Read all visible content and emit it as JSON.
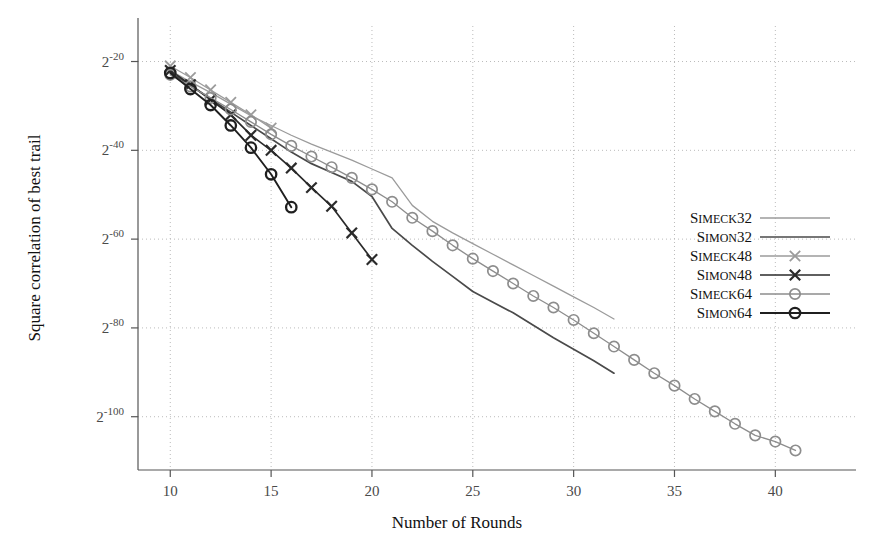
{
  "chart_data": {
    "type": "line",
    "title": "",
    "xlabel": "Number of Rounds",
    "ylabel": "Square correlation of best trail",
    "xlim": [
      8.4,
      44
    ],
    "ylim": [
      -112,
      -12
    ],
    "grid": true,
    "xticks": [
      10,
      15,
      20,
      25,
      30,
      35,
      40
    ],
    "xtick_labels": [
      "10",
      "15",
      "20",
      "25",
      "30",
      "35",
      "40"
    ],
    "yticks": [
      -20,
      -40,
      -60,
      -80,
      -100
    ],
    "ytick_labels": [
      "2^-20",
      "2^-40",
      "2^-60",
      "2^-80",
      "2^-100"
    ],
    "ytick_base": "2",
    "ytick_exponents": [
      "-20",
      "-40",
      "-60",
      "-80",
      "-100"
    ],
    "legend_position": "right-middle",
    "series": [
      {
        "name": "Simeck32",
        "label_small_caps": "IMECK",
        "label_head": "S",
        "label_tail": "32",
        "color": "#9b9b9b",
        "marker": "none",
        "width": 1.3,
        "x": [
          10,
          11,
          12,
          13,
          14,
          15,
          16,
          17,
          18,
          19,
          20,
          21,
          22,
          23,
          24,
          25,
          26,
          27,
          28,
          29,
          30,
          31,
          32
        ],
        "y": [
          -22.0,
          -24.6,
          -27.0,
          -29.6,
          -32.2,
          -34.4,
          -36.6,
          -38.6,
          -40.4,
          -42.2,
          -44.2,
          -46.2,
          -52.4,
          -56.0,
          -58.6,
          -61.0,
          -63.4,
          -65.8,
          -68.2,
          -70.6,
          -73.0,
          -75.4,
          -78.0
        ]
      },
      {
        "name": "Simon32",
        "label_head": "S",
        "label_small_caps": "IMON",
        "label_tail": "32",
        "color": "#4a4a4a",
        "marker": "none",
        "width": 1.7,
        "x": [
          10,
          11,
          12,
          13,
          14,
          15,
          16,
          17,
          18,
          19,
          20,
          21,
          22,
          23,
          24,
          25,
          26,
          27,
          28,
          29,
          30,
          31,
          32
        ],
        "y": [
          -22.4,
          -25.4,
          -28.4,
          -31.4,
          -34.4,
          -37.4,
          -40.4,
          -43.0,
          -45.0,
          -47.0,
          -50.4,
          -57.6,
          -61.4,
          -65.0,
          -68.4,
          -71.8,
          -74.2,
          -76.6,
          -79.4,
          -82.2,
          -84.8,
          -87.4,
          -90.2
        ]
      },
      {
        "name": "Simeck48",
        "label_head": "S",
        "label_small_caps": "IMECK",
        "label_tail": "48",
        "color": "#9b9b9b",
        "marker": "x",
        "width": 1.3,
        "x": [
          10,
          11,
          12,
          13,
          14,
          15
        ],
        "y": [
          -21.0,
          -23.6,
          -26.4,
          -29.2,
          -32.0,
          -35.0
        ]
      },
      {
        "name": "Simon48",
        "label_head": "S",
        "label_small_caps": "IMON",
        "label_tail": "48",
        "color": "#2a2a2a",
        "marker": "x",
        "width": 1.7,
        "x": [
          10,
          11,
          12,
          13,
          14,
          15,
          16,
          17,
          18,
          19,
          20
        ],
        "y": [
          -22.0,
          -25.2,
          -28.6,
          -32.0,
          -36.6,
          -40.0,
          -44.0,
          -48.4,
          -52.6,
          -58.6,
          -64.6
        ]
      },
      {
        "name": "Simeck64",
        "label_head": "S",
        "label_small_caps": "IMECK",
        "label_tail": "64",
        "color": "#8d8d8d",
        "marker": "circle",
        "width": 1.3,
        "x": [
          10,
          11,
          12,
          13,
          14,
          15,
          16,
          17,
          18,
          19,
          20,
          21,
          22,
          23,
          24,
          25,
          26,
          27,
          28,
          29,
          30,
          31,
          32,
          33,
          34,
          35,
          36,
          37,
          38,
          39,
          40,
          41
        ],
        "y": [
          -23.0,
          -25.6,
          -28.2,
          -30.8,
          -33.6,
          -36.4,
          -39.0,
          -41.4,
          -43.8,
          -46.2,
          -48.8,
          -51.6,
          -55.2,
          -58.2,
          -61.4,
          -64.4,
          -67.2,
          -70.0,
          -72.8,
          -75.4,
          -78.2,
          -81.2,
          -84.2,
          -87.2,
          -90.2,
          -93.0,
          -96.0,
          -98.8,
          -101.6,
          -104.2,
          -105.6,
          -107.6
        ]
      },
      {
        "name": "Simon64",
        "label_head": "S",
        "label_small_caps": "IMON",
        "label_tail": "64",
        "color": "#1f1f1f",
        "marker": "circle",
        "width": 1.9,
        "x": [
          10,
          11,
          12,
          13,
          14,
          15,
          16
        ],
        "y": [
          -22.6,
          -26.2,
          -29.8,
          -34.4,
          -39.4,
          -45.4,
          -52.8
        ]
      }
    ]
  },
  "legend": {
    "entries": [
      {
        "text": "Simeck32"
      },
      {
        "text": "Simon32"
      },
      {
        "text": "Simeck48"
      },
      {
        "text": "Simon48"
      },
      {
        "text": "Simeck64"
      },
      {
        "text": "Simon64"
      }
    ]
  },
  "colors": {
    "axis": "#555555",
    "grid": "#bbbbbb",
    "background": "#ffffff"
  }
}
